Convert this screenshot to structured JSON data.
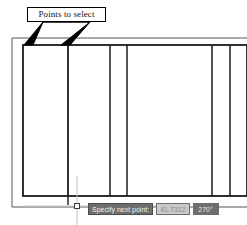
{
  "callout": {
    "label": "Points to select"
  },
  "dynamic_input": {
    "prompt": "Specify next point:",
    "distance_value": "41.7312",
    "angle_value": "270",
    "angle_unit": "°"
  },
  "cursor": {
    "name": "pickbox-crosshair"
  },
  "drawing": {
    "title": "Wall elevation with mullions",
    "colors": {
      "outline": "#111111",
      "thin_line": "#555555",
      "background": "#ffffff"
    }
  }
}
